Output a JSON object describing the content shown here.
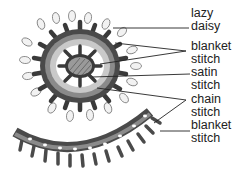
{
  "diagram": {
    "labels": [
      {
        "line1": "lazy",
        "line2": "daisy",
        "top": 7
      },
      {
        "line1": "blanket",
        "line2": "stitch",
        "top": 40
      },
      {
        "line1": "satin",
        "line2": "stitch",
        "top": 66
      },
      {
        "line1": "chain",
        "line2": "stitch",
        "top": 93
      },
      {
        "line1": "blanket",
        "line2": "stitch",
        "top": 119
      }
    ],
    "colors": {
      "ink": "#2e2e2e",
      "dark_band": "#4a4a4a",
      "mid_band": "#8a8a8a",
      "light_band": "#c9c9c9",
      "petal": "#f2f2f2"
    }
  }
}
